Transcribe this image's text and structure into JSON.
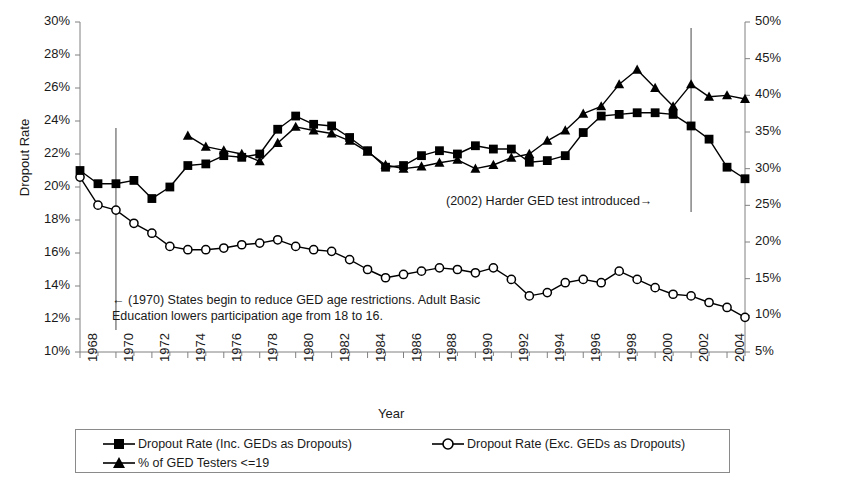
{
  "chart_data": {
    "type": "line",
    "title": "",
    "xlabel": "Year",
    "ylabel": "Dropout Rate",
    "y2label": "% GED Testers Less Than 20",
    "grid": false,
    "legend_position": "bottom",
    "xlim": [
      1968,
      2005
    ],
    "ylim": [
      10,
      30
    ],
    "y2lim": [
      5,
      50
    ],
    "y_ticks": [
      "10%",
      "12%",
      "14%",
      "16%",
      "18%",
      "20%",
      "22%",
      "24%",
      "26%",
      "28%",
      "30%"
    ],
    "y2_ticks": [
      "5%",
      "10%",
      "15%",
      "20%",
      "25%",
      "30%",
      "35%",
      "40%",
      "45%",
      "50%"
    ],
    "x_ticks": [
      "1968",
      "1970",
      "1972",
      "1974",
      "1976",
      "1978",
      "1980",
      "1982",
      "1984",
      "1986",
      "1988",
      "1990",
      "1992",
      "1994",
      "1996",
      "1998",
      "2000",
      "2002",
      "2004"
    ],
    "x": [
      1968,
      1969,
      1970,
      1971,
      1972,
      1973,
      1974,
      1975,
      1976,
      1977,
      1978,
      1979,
      1980,
      1981,
      1982,
      1983,
      1984,
      1985,
      1986,
      1987,
      1988,
      1989,
      1990,
      1991,
      1992,
      1993,
      1994,
      1995,
      1996,
      1997,
      1998,
      1999,
      2000,
      2001,
      2002,
      2003,
      2004,
      2005
    ],
    "series": [
      {
        "name": "Dropout Rate (Inc. GEDs as Dropouts)",
        "marker": "square",
        "axis": "left",
        "values": [
          21.0,
          20.2,
          20.2,
          20.4,
          19.3,
          20.0,
          21.3,
          21.4,
          21.9,
          21.8,
          22.0,
          23.5,
          24.3,
          23.8,
          23.7,
          23.0,
          22.2,
          21.2,
          21.3,
          21.9,
          22.2,
          22.0,
          22.5,
          22.3,
          22.3,
          21.5,
          21.6,
          21.9,
          23.3,
          24.3,
          24.4,
          24.5,
          24.5,
          24.4,
          23.7,
          22.9,
          21.2,
          20.5
        ]
      },
      {
        "name": "Dropout Rate (Exc. GEDs as Dropouts)",
        "marker": "circle-open",
        "axis": "left",
        "values": [
          20.6,
          18.9,
          18.6,
          17.8,
          17.2,
          16.4,
          16.2,
          16.2,
          16.3,
          16.5,
          16.6,
          16.8,
          16.4,
          16.2,
          16.1,
          15.6,
          15.0,
          14.5,
          14.7,
          14.9,
          15.1,
          15.0,
          14.8,
          15.1,
          14.4,
          13.4,
          13.6,
          14.2,
          14.4,
          14.2,
          14.9,
          14.4,
          13.9,
          13.5,
          13.4,
          13.0,
          12.7,
          12.1
        ]
      },
      {
        "name": "% of GED Testers <=19",
        "marker": "triangle",
        "axis": "right",
        "values": [
          null,
          null,
          null,
          null,
          null,
          null,
          34.5,
          33.0,
          32.5,
          32.0,
          31.0,
          33.5,
          35.7,
          35.2,
          34.8,
          33.8,
          32.3,
          30.5,
          30.0,
          30.3,
          30.8,
          31.2,
          30.0,
          30.5,
          31.5,
          32.0,
          33.8,
          35.2,
          37.5,
          38.5,
          41.5,
          43.5,
          41.0,
          38.5,
          41.5,
          39.8,
          40.0,
          39.5
        ]
      }
    ],
    "annotations": [
      {
        "id": "annot-1970",
        "line1": "← (1970) States begin to reduce GED age restrictions. Adult Basic",
        "line2": "Education lowers participation age from 18 to 16.",
        "marker_year": 1970
      },
      {
        "id": "annot-2002",
        "line1": "(2002) Harder GED  test introduced→",
        "marker_year": 2002
      }
    ],
    "reference_lines": [
      1970,
      2002
    ],
    "colors": {
      "series": "#000000",
      "axis": "#808080",
      "text": "#1a1a1a",
      "background": "#ffffff"
    }
  }
}
